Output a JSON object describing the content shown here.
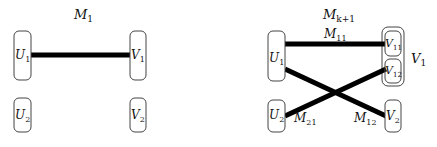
{
  "left": {
    "title": "M",
    "title_sub": "1",
    "nodes": [
      {
        "id": "U1",
        "label": "U",
        "sub": "1"
      },
      {
        "id": "U2",
        "label": "U",
        "sub": "2"
      },
      {
        "id": "V1",
        "label": "V",
        "sub": "1"
      },
      {
        "id": "V2",
        "label": "V",
        "sub": "2"
      }
    ],
    "edges": [
      {
        "from": "U1",
        "to": "V1"
      }
    ]
  },
  "right": {
    "title": "M",
    "title_sub": "k+1",
    "nodes": [
      {
        "id": "U1",
        "label": "U",
        "sub": "1"
      },
      {
        "id": "U2",
        "label": "U",
        "sub": "2"
      },
      {
        "id": "V11",
        "label": "V",
        "sub": "11"
      },
      {
        "id": "V12",
        "label": "V",
        "sub": "12"
      },
      {
        "id": "V2",
        "label": "V",
        "sub": "2"
      }
    ],
    "group": {
      "id": "V1",
      "label": "V",
      "sub": "1"
    },
    "edges": [
      {
        "from": "U1",
        "to": "V11",
        "label": "M",
        "sub": "11"
      },
      {
        "from": "U2",
        "to": "V12",
        "label": "M",
        "sub": "21"
      },
      {
        "from": "U1",
        "to": "V2",
        "label": "M",
        "sub": "12"
      }
    ]
  }
}
